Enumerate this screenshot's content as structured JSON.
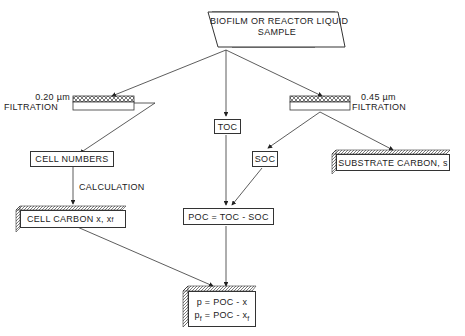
{
  "diagram": {
    "nodes": {
      "sample": {
        "line1": "BIOFILM  OR  REACTOR  LIQUID",
        "line2": "SAMPLE"
      },
      "filter_small": {
        "label_size": "0.20 µm",
        "label_text": "FILTRATION"
      },
      "filter_large": {
        "label_size": "0.45 µm",
        "label_text": "FILTRATION"
      },
      "toc": "TOC",
      "soc": "SOC",
      "cell_numbers": "CELL  NUMBERS",
      "calculation": "CALCULATION",
      "cell_carbon": "CELL  CARBON  x, x",
      "cell_carbon_sub": "f",
      "substrate_carbon": "SUBSTRATE  CARBON,  s",
      "poc": "POC = TOC - SOC",
      "result_line1": "p = POC - x",
      "result_line2_p": "p",
      "result_line2_psub": "f",
      "result_line2_mid": " = POC - x",
      "result_line2_xsub": "f"
    },
    "colors": {
      "line": "#333333",
      "hatch": "#555555",
      "background": "#ffffff"
    }
  }
}
